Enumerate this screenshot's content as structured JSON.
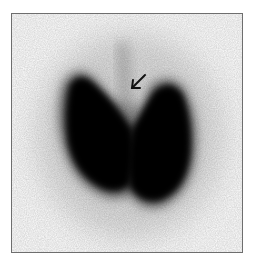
{
  "image": {
    "description": "Thyroid scintigraphy (anterior view) showing enlarged bilateral lobes with a pyramidal lobe indicated by an arrow",
    "colors": {
      "background": "#ffffff",
      "border": "#6e6e6e",
      "uptake_dense": "#050505",
      "uptake_faint": "#d9d9d9",
      "arrow": "#111111"
    },
    "annotations": [
      {
        "type": "arrow",
        "direction": "down-left",
        "target": "pyramidal-lobe"
      }
    ]
  }
}
